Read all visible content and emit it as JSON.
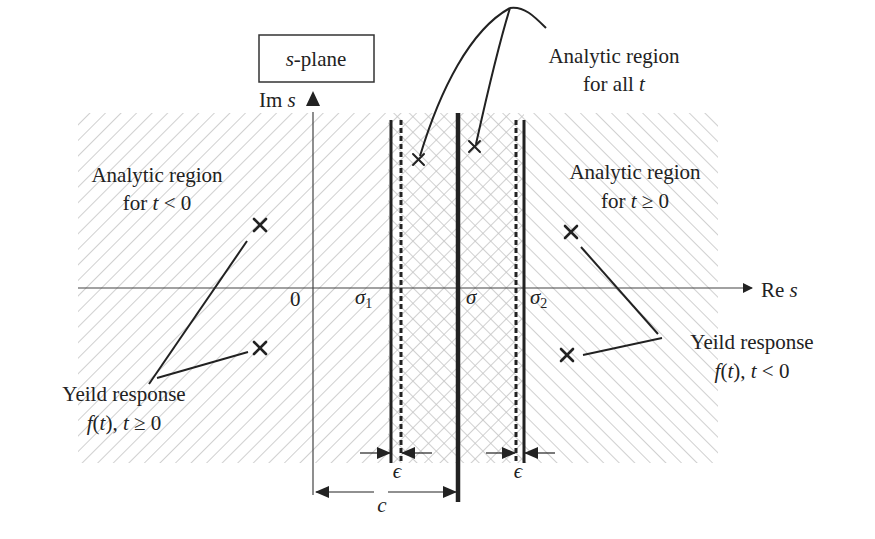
{
  "title_box": {
    "label_italic": "s",
    "label_rest": "-plane"
  },
  "axes": {
    "im_label": "Im ",
    "im_var": "s",
    "re_label": "Re ",
    "re_var": "s",
    "origin": "0"
  },
  "markers": {
    "sigma1": {
      "symbol": "σ",
      "sub": "1"
    },
    "sigma": {
      "symbol": "σ"
    },
    "sigma2": {
      "symbol": "σ",
      "sub": "2"
    },
    "epsilon_left": "ϵ",
    "epsilon_right": "ϵ",
    "c": "c"
  },
  "annotations": {
    "all_t": {
      "line1": "Analytic region",
      "line2_prefix": "for all ",
      "line2_var": "t"
    },
    "t_neg": {
      "line1": "Analytic region",
      "line2_prefix": "for ",
      "line2_var": "t",
      "line2_suffix": " < 0"
    },
    "t_pos": {
      "line1": "Analytic region",
      "line2_prefix": "for ",
      "line2_var": "t",
      "line2_suffix": " ≥ 0"
    },
    "yield_right": {
      "line1": "Yeild response",
      "line2_f": "f",
      "line2_mid": "(",
      "line2_var": "t",
      "line2_suffix": "), ",
      "line2_var2": "t",
      "line2_end": " < 0"
    },
    "yield_left": {
      "line1": "Yeild response",
      "line2_f": "f",
      "line2_mid": "(",
      "line2_var": "t",
      "line2_suffix": "), ",
      "line2_var2": "t",
      "line2_end": " ≥ 0"
    }
  },
  "poles": [
    {
      "name": "pole-left-upper",
      "x": 260,
      "y": 225
    },
    {
      "name": "pole-left-lower",
      "x": 260,
      "y": 348
    },
    {
      "name": "pole-strip-left",
      "x": 418,
      "y": 159
    },
    {
      "name": "pole-strip-right",
      "x": 474,
      "y": 147
    },
    {
      "name": "pole-right-upper",
      "x": 571,
      "y": 232
    },
    {
      "name": "pole-right-lower",
      "x": 567,
      "y": 355
    }
  ],
  "colors": {
    "ink": "#222222",
    "hatch": "#bdbdbd"
  }
}
